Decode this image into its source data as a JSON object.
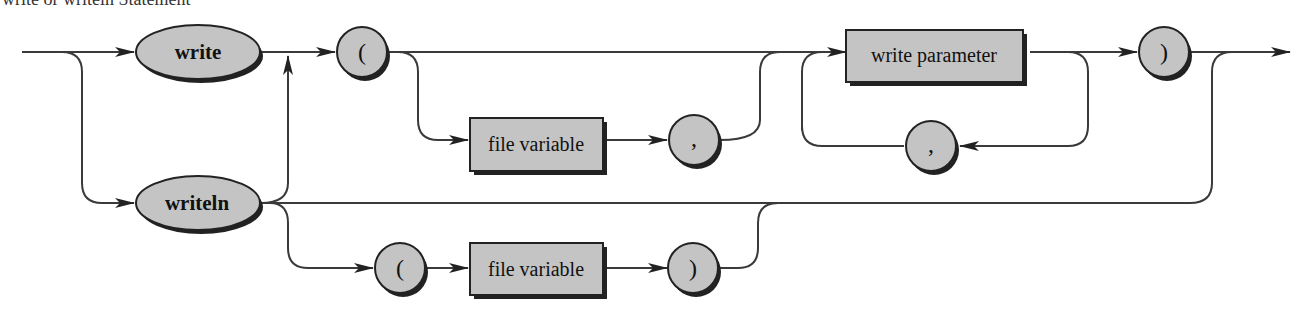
{
  "title": "write or writeln Statement",
  "colors": {
    "node_fill": "#c4c4c4",
    "node_stroke": "#222222",
    "line": "#3a3a3a",
    "background": "#ffffff"
  },
  "nodes": {
    "write": {
      "type": "terminal-ellipse",
      "label": "write"
    },
    "writeln": {
      "type": "terminal-ellipse",
      "label": "writeln"
    },
    "lparen_top": {
      "type": "terminal-circle",
      "label": "("
    },
    "file_variable_top": {
      "type": "nonterminal-box",
      "label": "file variable"
    },
    "comma_top": {
      "type": "terminal-circle",
      "label": ","
    },
    "write_parameter": {
      "type": "nonterminal-box",
      "label": "write parameter"
    },
    "comma_loop": {
      "type": "terminal-circle",
      "label": ","
    },
    "rparen_top": {
      "type": "terminal-circle",
      "label": ")"
    },
    "lparen_bottom": {
      "type": "terminal-circle",
      "label": "("
    },
    "file_variable_bottom": {
      "type": "nonterminal-box",
      "label": "file variable"
    },
    "rparen_bottom": {
      "type": "terminal-circle",
      "label": ")"
    }
  },
  "edges": [
    [
      "start",
      "write"
    ],
    [
      "start",
      "writeln"
    ],
    [
      "write",
      "lparen_top"
    ],
    [
      "writeln",
      "lparen_top"
    ],
    [
      "lparen_top",
      "write_parameter"
    ],
    [
      "lparen_top",
      "file_variable_top"
    ],
    [
      "file_variable_top",
      "comma_top"
    ],
    [
      "comma_top",
      "write_parameter"
    ],
    [
      "write_parameter",
      "rparen_top"
    ],
    [
      "write_parameter",
      "comma_loop"
    ],
    [
      "comma_loop",
      "write_parameter"
    ],
    [
      "rparen_top",
      "end"
    ],
    [
      "writeln",
      "end"
    ],
    [
      "writeln",
      "lparen_bottom"
    ],
    [
      "lparen_bottom",
      "file_variable_bottom"
    ],
    [
      "file_variable_bottom",
      "rparen_bottom"
    ],
    [
      "rparen_bottom",
      "end"
    ]
  ]
}
